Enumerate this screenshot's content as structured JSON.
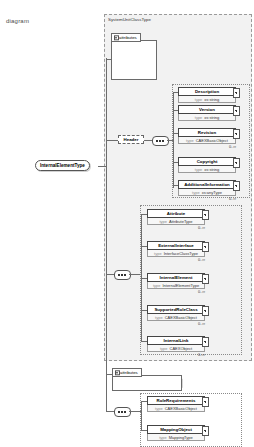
{
  "row_label": "diagram",
  "groups": {
    "main": {
      "title": "SystemUnitClassType"
    }
  },
  "attributes_label": "attributes",
  "root": {
    "name": "InternalElementType"
  },
  "type_keyword": "type",
  "top_attributes": [
    {
      "name": "ChangeMode",
      "style": "dashed"
    },
    {
      "name": "ID",
      "style": "dashed"
    },
    {
      "name": "Name",
      "style": "solid"
    }
  ],
  "header": {
    "name": "Header",
    "children": [
      {
        "name": "Description",
        "type": "xs:string",
        "card": ""
      },
      {
        "name": "Version",
        "type": "xs:string",
        "card": ""
      },
      {
        "name": "Revision",
        "type": "CAEXBasicObject",
        "card": "0..∞"
      },
      {
        "name": "Copyright",
        "type": "xs:string",
        "card": ""
      },
      {
        "name": "AdditionalInformation",
        "type": "xs:anyType",
        "card": "0..∞"
      }
    ]
  },
  "body": {
    "children": [
      {
        "name": "Attribute",
        "type": "AttributeType",
        "card": "0..∞"
      },
      {
        "name": "ExternalInterface",
        "type": "InterfaceClassType",
        "card": "0..∞"
      },
      {
        "name": "InternalElement",
        "type": "InternalElementType",
        "card": "0..∞"
      },
      {
        "name": "SupportedRoleClass",
        "type": "CAEXBasicObject",
        "card": "0..∞"
      },
      {
        "name": "InternalLink",
        "type": "CAEXObject",
        "card": "0..∞"
      }
    ]
  },
  "bottom": {
    "attribute": {
      "name": "RefBaseSystemUnitPath"
    },
    "children": [
      {
        "name": "RoleRequirements",
        "type": "CAEXBasicObject",
        "card": ""
      },
      {
        "name": "MappingObject",
        "type": "MappingType",
        "card": ""
      }
    ]
  }
}
